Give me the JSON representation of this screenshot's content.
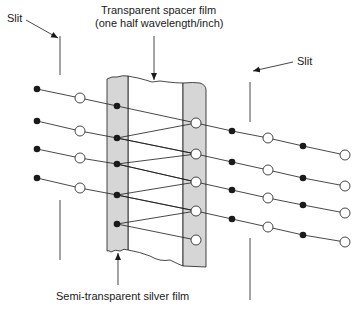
{
  "labels": {
    "slit_left": "Slit",
    "slit_right": "Slit",
    "spacer_line1": "Transparent spacer film",
    "spacer_line2": "(one half wavelength/inch)",
    "silver_film": "Semi-transparent silver film"
  },
  "colors": {
    "ink": "#1a1a1a",
    "film_fill": "#d9d9d9",
    "open_fill": "#ffffff",
    "background": "#ffffff"
  },
  "geometry": {
    "left_film": {
      "x1": 107,
      "x2": 128,
      "top": 76,
      "bottom": 250
    },
    "right_film": {
      "x1": 183,
      "x2": 206,
      "top": 83,
      "bottom": 267
    },
    "rows": [
      {
        "pts": [
          [
            37,
            89,
            "filled"
          ],
          [
            80,
            98,
            "open"
          ],
          [
            117,
            106,
            "filled"
          ],
          [
            196,
            123,
            "open"
          ],
          [
            232,
            131,
            "filled"
          ],
          [
            268,
            138,
            "open"
          ],
          [
            303,
            146,
            "filled"
          ],
          [
            345,
            155,
            "open"
          ]
        ]
      },
      {
        "pts": [
          [
            37,
            121,
            "filled"
          ],
          [
            80,
            131,
            "open"
          ],
          [
            117,
            138,
            "filled"
          ],
          [
            196,
            154,
            "open"
          ],
          [
            232,
            162,
            "filled"
          ],
          [
            268,
            170,
            "open"
          ],
          [
            303,
            178,
            "filled"
          ],
          [
            345,
            186,
            "open"
          ]
        ]
      },
      {
        "pts": [
          [
            37,
            149,
            "filled"
          ],
          [
            80,
            158,
            "open"
          ],
          [
            117,
            164,
            "filled"
          ],
          [
            196,
            182,
            "open"
          ],
          [
            232,
            190,
            "filled"
          ],
          [
            268,
            198,
            "open"
          ],
          [
            303,
            205,
            "filled"
          ],
          [
            345,
            213,
            "open"
          ]
        ]
      },
      {
        "pts": [
          [
            37,
            178,
            "filled"
          ],
          [
            80,
            188,
            "open"
          ],
          [
            117,
            195,
            "filled"
          ],
          [
            196,
            211,
            "open"
          ],
          [
            232,
            219,
            "filled"
          ],
          [
            268,
            227,
            "open"
          ],
          [
            303,
            235,
            "filled"
          ],
          [
            345,
            242,
            "open"
          ]
        ]
      }
    ],
    "extra_filled": [
      117,
      224
    ],
    "extra_open": [
      196,
      240
    ],
    "reflections": [
      [
        [
          196,
          123
        ],
        [
          117,
          138
        ]
      ],
      [
        [
          117,
          138
        ],
        [
          196,
          154
        ]
      ],
      [
        [
          196,
          154
        ],
        [
          117,
          164
        ]
      ],
      [
        [
          117,
          164
        ],
        [
          196,
          182
        ]
      ],
      [
        [
          196,
          182
        ],
        [
          117,
          195
        ]
      ],
      [
        [
          117,
          195
        ],
        [
          196,
          211
        ]
      ],
      [
        [
          196,
          211
        ],
        [
          117,
          224
        ]
      ],
      [
        [
          117,
          224
        ],
        [
          196,
          240
        ]
      ]
    ],
    "slits": [
      {
        "x": 60,
        "y1": 36,
        "y2": 75
      },
      {
        "x": 60,
        "y1": 200,
        "y2": 260
      },
      {
        "x": 250,
        "y1": 82,
        "y2": 122
      },
      {
        "x": 250,
        "y1": 238,
        "y2": 300
      }
    ]
  }
}
